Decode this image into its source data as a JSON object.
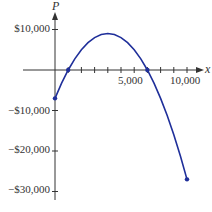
{
  "chart_data": {
    "type": "line",
    "title": "",
    "xlabel": "x",
    "ylabel": "P",
    "xlim": [
      0,
      10000
    ],
    "ylim": [
      -30000,
      10000
    ],
    "x_ticks": [
      1000,
      2000,
      3000,
      4000,
      5000,
      6000,
      7000,
      8000,
      9000,
      10000
    ],
    "x_tick_labels": [
      {
        "value": 5000,
        "label": "5,000"
      },
      {
        "value": 10000,
        "label": "10,000"
      }
    ],
    "y_ticks": [
      10000,
      -10000,
      -20000,
      -30000
    ],
    "y_tick_labels": [
      "$10,000",
      "−$10,000",
      "−$20,000",
      "−$30,000"
    ],
    "grid": false,
    "legend": null,
    "series": [
      {
        "name": "P(x)",
        "color": "#1f2f9a",
        "x": [
          0,
          500,
          1000,
          1500,
          2000,
          2500,
          3000,
          3500,
          4000,
          4500,
          5000,
          5500,
          6000,
          6500,
          7000,
          7500,
          8000,
          8500,
          9000,
          9500,
          10000
        ],
        "values": [
          -7000,
          -3250,
          0,
          2750,
          5000,
          6750,
          8000,
          8750,
          9000,
          8750,
          8000,
          6750,
          5000,
          2750,
          0,
          -3250,
          -7000,
          -11250,
          -16000,
          -21250,
          -27000
        ]
      }
    ],
    "marked_points": [
      {
        "x": 0,
        "y": -7000
      },
      {
        "x": 1000,
        "y": 0
      },
      {
        "x": 7000,
        "y": 0
      },
      {
        "x": 10000,
        "y": -27000
      }
    ]
  },
  "labels": {
    "y_axis_name": "P",
    "x_axis_name": "x",
    "y10k": "$10,000",
    "yneg10k": "−$10,000",
    "yneg20k": "−$20,000",
    "yneg30k": "−$30,000",
    "x5k": "5,000",
    "x10k": "10,000"
  }
}
